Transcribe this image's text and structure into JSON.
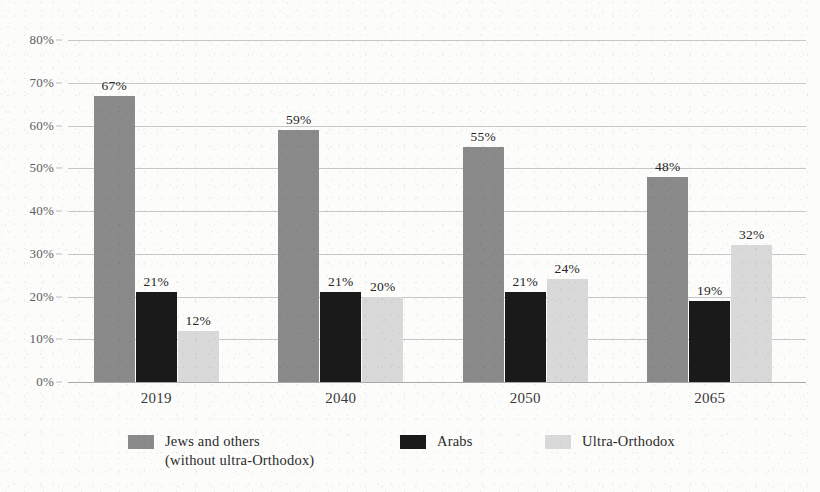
{
  "chart_data": {
    "type": "bar",
    "title": "",
    "xlabel": "",
    "ylabel": "",
    "ylim": [
      0,
      80
    ],
    "ytick_step": 10,
    "grid": true,
    "legend_position": "bottom",
    "value_labels": true,
    "value_label_suffix": "%",
    "categories": [
      "2019",
      "2040",
      "2050",
      "2065"
    ],
    "ytick_labels": [
      "80%",
      "70%",
      "60%",
      "50%",
      "40%",
      "30%",
      "20%",
      "10%",
      "0%"
    ],
    "ytick_values": [
      80,
      70,
      60,
      50,
      40,
      30,
      20,
      10,
      0
    ],
    "series": [
      {
        "name": "Jews and others (without ultra-Orthodox)",
        "legend_line1": "Jews and others",
        "legend_line2": "(without ultra-Orthodox)",
        "color": "#8a8a8a",
        "values": [
          67,
          59,
          55,
          48
        ],
        "value_labels": [
          "67%",
          "59%",
          "55%",
          "48%"
        ]
      },
      {
        "name": "Arabs",
        "legend_line1": "Arabs",
        "legend_line2": "",
        "color": "#1a1a1a",
        "values": [
          21,
          21,
          21,
          19
        ],
        "value_labels": [
          "21%",
          "21%",
          "21%",
          "19%"
        ]
      },
      {
        "name": "Ultra-Orthodox",
        "legend_line1": "Ultra-Orthodox",
        "legend_line2": "",
        "color": "#d9d9d9",
        "values": [
          12,
          20,
          24,
          32
        ],
        "value_labels": [
          "12%",
          "20%",
          "24%",
          "32%"
        ]
      }
    ]
  },
  "style": {
    "background": "#fcfcfb",
    "gridline_color": "#bdbdbd",
    "axis_color": "#9a9a9a",
    "text_color": "#2b2b2b",
    "ytick_text_color": "#5d5d5d"
  }
}
